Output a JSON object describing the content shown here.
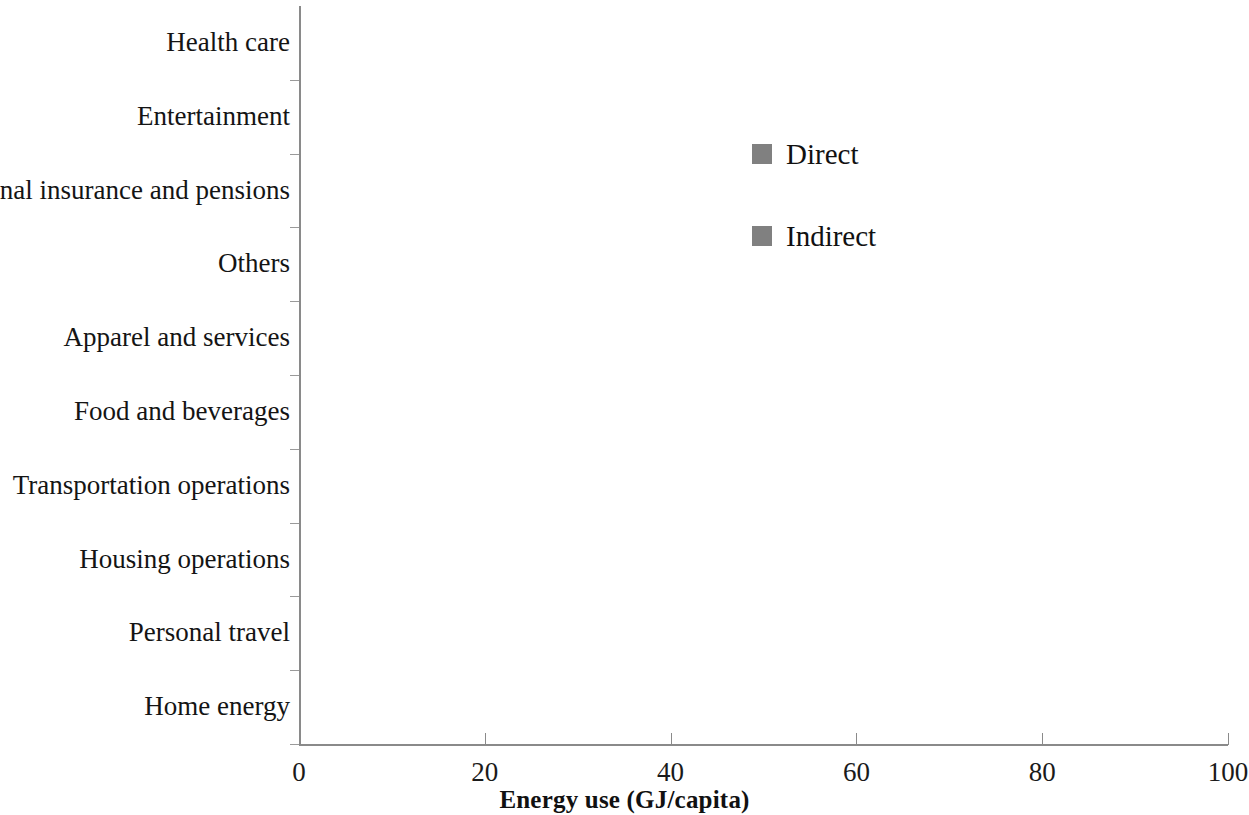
{
  "chart_data": {
    "type": "bar",
    "orientation": "horizontal",
    "title": "",
    "xlabel": "Energy use (GJ/capita)",
    "ylabel": "",
    "xlim": [
      0,
      100
    ],
    "xticks": [
      "0",
      "20",
      "40",
      "60",
      "80",
      "100"
    ],
    "grid": false,
    "legend_position": "upper right inside plot",
    "categories": [
      "Health care",
      "Entertainment",
      "Personal insurance and pensions",
      "Others",
      "Apparel and services",
      "Food and beverages",
      "Transportation operations",
      "Housing operations",
      "Personal travel",
      "Home energy"
    ],
    "series": [
      {
        "name": "Indirect",
        "color": "#808080",
        "values": [
          2.2,
          4.5,
          4.5,
          6.1,
          10.0,
          23.8,
          64.6,
          94.7,
          64.6,
          41.0
        ]
      }
    ],
    "legend": [
      {
        "label": "Direct",
        "color": "#808080"
      },
      {
        "label": "Indirect",
        "color": "#808080"
      }
    ],
    "notes": {
      "category_order_top_to_bottom": "Health care is topmost, Home energy is bottom-most",
      "units": "GJ/capita"
    }
  },
  "axis": {
    "x_title": "Energy use (GJ/capita)",
    "ticks": [
      {
        "label": "0",
        "value": 0
      },
      {
        "label": "20",
        "value": 20
      },
      {
        "label": "40",
        "value": 40
      },
      {
        "label": "60",
        "value": 60
      },
      {
        "label": "80",
        "value": 80
      },
      {
        "label": "100",
        "value": 100
      }
    ]
  },
  "legend": {
    "items": [
      {
        "label": "Direct"
      },
      {
        "label": "Indirect"
      }
    ]
  },
  "colors": {
    "bar": "#808080",
    "axis": "#8a8a8a",
    "text": "#141414",
    "background": "#ffffff"
  }
}
